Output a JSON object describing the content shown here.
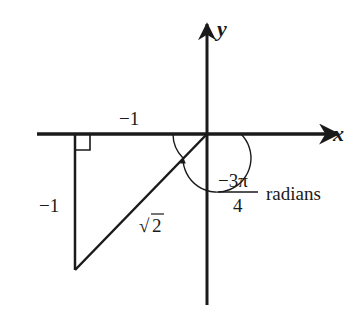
{
  "diagram": {
    "type": "unit-circle-reference-triangle",
    "axes": {
      "x_label": "x",
      "y_label": "y"
    },
    "triangle": {
      "horizontal_leg_label": "−1",
      "vertical_leg_label": "−1",
      "hypotenuse_radical": "√",
      "hypotenuse_radicand": "2",
      "right_angle_marker": true
    },
    "angle": {
      "numerator": "−3π",
      "denominator": "4",
      "unit": "radians",
      "direction": "clockwise"
    },
    "colors": {
      "stroke": "#1a1a1a",
      "background": "#ffffff"
    }
  }
}
